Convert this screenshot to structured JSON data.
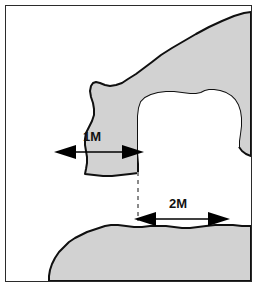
{
  "figure": {
    "type": "technical-plan-diagram",
    "canvas": {
      "width": 257,
      "height": 287
    },
    "border": {
      "color": "#2b2b2b",
      "width": 1
    },
    "colors": {
      "rock_fill": "#d2d2d2",
      "rock_outline": "#101010",
      "void_fill": "#ffffff",
      "dashed_line": "#8a8a8a",
      "arrow": "#000000",
      "label_text": "#111111",
      "page_background": "#ffffff"
    },
    "regions": [
      {
        "name": "upper-rock-mass",
        "label": "Upper rock mass",
        "fill": "#d2d2d2",
        "description": "Large shaded rock body entering from the top-right and sweeping down to the left, forming the ceiling and the left wall of the upper corridor."
      },
      {
        "name": "lower-rock-mass",
        "label": "Lower rock mass",
        "fill": "#d2d2d2",
        "description": "Shaded rock body occupying the bottom of the frame, forming the floor below the lower corridor."
      },
      {
        "name": "central-chamber",
        "label": "Central chamber",
        "fill": "#ffffff",
        "description": "Irregular white open chamber carved into the right side of the rock, joined to the left passage and the lower passage."
      },
      {
        "name": "left-passage",
        "label": "Left passage",
        "fill": "#d2d2d2",
        "description": "Corridor span measured by the 1M dimension arrow."
      },
      {
        "name": "lower-passage",
        "label": "Lower passage",
        "fill": "#ffffff",
        "description": "Corridor span measured by the 2M dimension arrow."
      }
    ],
    "dimensions": [
      {
        "id": "dim-1m",
        "label": "1M",
        "value": 1,
        "unit": "M",
        "orientation": "horizontal",
        "arrow_style": "double-headed",
        "label_position": "above-center",
        "x_start": 55,
        "x_end": 130,
        "y": 146,
        "label_x": 93,
        "label_y": 135
      },
      {
        "id": "dim-2m",
        "label": "2M",
        "value": 2,
        "unit": "M",
        "orientation": "horizontal",
        "arrow_style": "double-headed",
        "label_position": "above-center",
        "x_start": 135,
        "x_end": 222,
        "y": 213,
        "label_x": 179,
        "label_y": 202
      }
    ],
    "guides": [
      {
        "id": "reference-dashed-line",
        "label": "Vertical alignment reference",
        "style": "dashed",
        "color": "#8a8a8a",
        "x": 134,
        "y_start": 165,
        "y_end": 215
      }
    ]
  }
}
